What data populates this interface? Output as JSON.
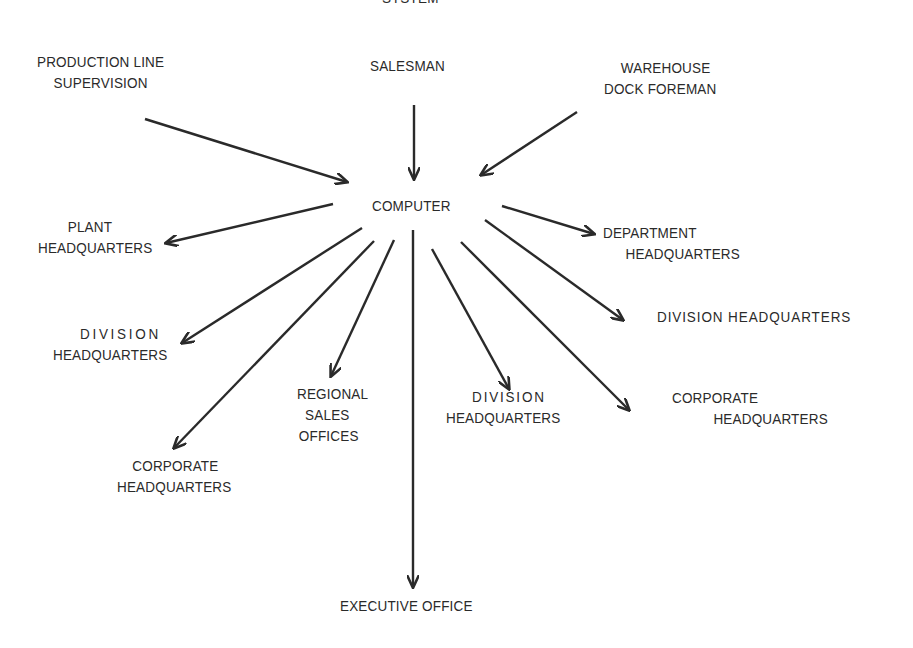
{
  "diagram": {
    "title_fragment": "SYSTEM",
    "center": "COMPUTER",
    "inputs": {
      "production_line": [
        "PRODUCTION LINE",
        "SUPERVISION"
      ],
      "salesman": [
        "SALESMAN"
      ],
      "warehouse": [
        "WAREHOUSE",
        "DOCK FOREMAN"
      ]
    },
    "outputs": {
      "plant_hq": [
        "PLANT",
        "HEADQUARTERS"
      ],
      "division_hq_left": [
        "DIVISION",
        "HEADQUARTERS"
      ],
      "corporate_hq_left": [
        "CORPORATE",
        "HEADQUARTERS"
      ],
      "regional_sales": [
        "REGIONAL",
        "SALES",
        "OFFICES"
      ],
      "executive_office": [
        "EXECUTIVE OFFICE"
      ],
      "division_hq_mid": [
        "DIVISION",
        "HEADQUARTERS"
      ],
      "corporate_hq_right": [
        "CORPORATE",
        "HEADQUARTERS"
      ],
      "division_hq_right": [
        "DIVISION HEADQUARTERS"
      ],
      "department_hq": [
        "DEPARTMENT",
        "HEADQUARTERS"
      ]
    },
    "colors": {
      "ink": "#2a2a2a",
      "background": "#ffffff"
    },
    "edges": [
      {
        "from": "production_line",
        "to": "computer"
      },
      {
        "from": "salesman",
        "to": "computer"
      },
      {
        "from": "warehouse",
        "to": "computer"
      },
      {
        "from": "computer",
        "to": "plant_hq"
      },
      {
        "from": "computer",
        "to": "division_hq_left"
      },
      {
        "from": "computer",
        "to": "corporate_hq_left"
      },
      {
        "from": "computer",
        "to": "regional_sales"
      },
      {
        "from": "computer",
        "to": "executive_office"
      },
      {
        "from": "computer",
        "to": "division_hq_mid"
      },
      {
        "from": "computer",
        "to": "corporate_hq_right"
      },
      {
        "from": "computer",
        "to": "division_hq_right"
      },
      {
        "from": "computer",
        "to": "department_hq"
      }
    ]
  }
}
